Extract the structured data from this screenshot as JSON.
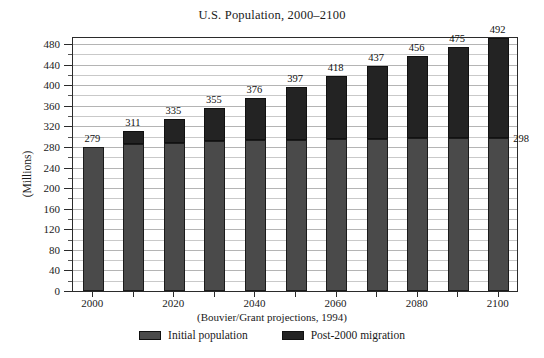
{
  "chart_data": {
    "type": "bar",
    "subtype": "stacked",
    "title": "U.S. Population, 2000–2100",
    "xlabel": "",
    "ylabel": "(Millions)",
    "ylim": [
      0,
      480
    ],
    "ytick_step": 40,
    "yminor_step": 20,
    "grid": true,
    "legend_position": "bottom",
    "source_note": "(Bouvier/Grant projections, 1994)",
    "categories": [
      "2000",
      "2010",
      "2020",
      "2030",
      "2040",
      "2050",
      "2060",
      "2070",
      "2080",
      "2090",
      "2100"
    ],
    "xtick_labels": [
      "2000",
      "",
      "2020",
      "",
      "2040",
      "",
      "2060",
      "",
      "2080",
      "",
      "2100"
    ],
    "totals": [
      279,
      311,
      335,
      355,
      376,
      397,
      418,
      437,
      456,
      475,
      492
    ],
    "series": [
      {
        "name": "Initial population",
        "color": "#4a4a4a",
        "values": [
          279,
          285,
          288,
          291,
          293,
          294,
          295,
          296,
          297,
          298,
          298
        ]
      },
      {
        "name": "Post-2000 migration",
        "color": "#232323",
        "values": [
          0,
          26,
          47,
          64,
          83,
          103,
          123,
          141,
          159,
          177,
          194
        ]
      }
    ],
    "ytick_labels": [
      "0",
      "40",
      "80",
      "120",
      "160",
      "200",
      "240",
      "280",
      "320",
      "360",
      "400",
      "440",
      "480"
    ],
    "annotations": [
      {
        "text": "298",
        "value": 298,
        "attached_to": "2100",
        "position": "right-of-last-bar-base-top"
      }
    ]
  },
  "legend": {
    "items": [
      {
        "label": "Initial population",
        "swatch": "base"
      },
      {
        "label": "Post-2000 migration",
        "swatch": "mig"
      }
    ]
  },
  "colors": {
    "base": "#4a4a4a",
    "migration": "#232323",
    "frame": "#2b2b2b",
    "grid": "#c9c9c9",
    "background": "#ffffff"
  }
}
